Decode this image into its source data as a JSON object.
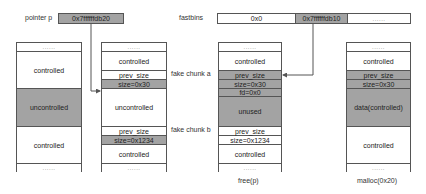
{
  "pointer": {
    "label": "pointer p",
    "value": "0x7ffffffdb20"
  },
  "fastbins": {
    "label": "fastbins",
    "cells": [
      "0x0",
      "0x7ffffffdb10",
      "......"
    ]
  },
  "columns": [
    {
      "id": "before",
      "caption": "",
      "cells": [
        {
          "text": "......",
          "fill": "white"
        },
        {
          "text": "controlled",
          "fill": "white"
        },
        {
          "text": "uncontrolled",
          "fill": "gray"
        },
        {
          "text": "controlled",
          "fill": "white"
        },
        {
          "text": "......",
          "fill": "white"
        }
      ]
    },
    {
      "id": "fake-chunks",
      "caption": "",
      "cells": [
        {
          "text": "......",
          "fill": "white"
        },
        {
          "text": "controlled",
          "fill": "white"
        },
        {
          "text": "prev_size",
          "fill": "white"
        },
        {
          "text": "size=0x30",
          "fill": "gray"
        },
        {
          "text": "uncontrolled",
          "fill": "white"
        },
        {
          "text": "prev_size",
          "fill": "white"
        },
        {
          "text": "size=0x1234",
          "fill": "gray"
        },
        {
          "text": "controlled",
          "fill": "white"
        },
        {
          "text": "......",
          "fill": "white"
        }
      ]
    },
    {
      "id": "free",
      "caption": "free(p)",
      "cells": [
        {
          "text": "......",
          "fill": "white"
        },
        {
          "text": "controlled",
          "fill": "white"
        },
        {
          "text": "prev_size",
          "fill": "gray"
        },
        {
          "text": "size=0x30",
          "fill": "gray"
        },
        {
          "text": "fd=0x0",
          "fill": "gray"
        },
        {
          "text": "unused",
          "fill": "gray"
        },
        {
          "text": "prev_size",
          "fill": "white"
        },
        {
          "text": "size=0x1234",
          "fill": "white"
        },
        {
          "text": "controlled",
          "fill": "white"
        },
        {
          "text": "......",
          "fill": "white"
        }
      ]
    },
    {
      "id": "malloc",
      "caption": "malloc(0x20)",
      "cells": [
        {
          "text": "......",
          "fill": "white"
        },
        {
          "text": "controlled",
          "fill": "white"
        },
        {
          "text": "prev_size",
          "fill": "gray"
        },
        {
          "text": "size=0x30",
          "fill": "gray"
        },
        {
          "text": "data(controlled)",
          "fill": "gray"
        },
        {
          "text": "controlled",
          "fill": "white"
        },
        {
          "text": "......",
          "fill": "white"
        }
      ]
    }
  ],
  "annotations": {
    "fake_chunk_a": "fake chunk a",
    "fake_chunk_b": "fake chunk b"
  },
  "colors": {
    "gray_fill": "#a3a3a3",
    "border": "#555555",
    "line": "#555555"
  }
}
